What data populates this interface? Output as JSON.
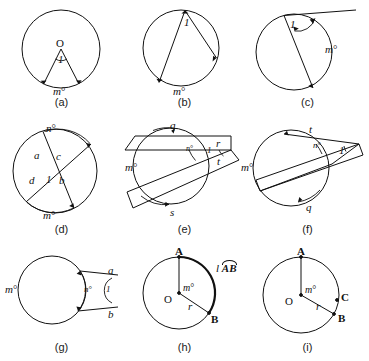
{
  "figure": {
    "title_visible": false,
    "panel_count": 9
  },
  "panels": [
    {
      "id": "a",
      "caption": "(a)",
      "type": "central-angle",
      "labels": {
        "center": "O",
        "angle": "1",
        "arc": "m",
        "degree": "°"
      }
    },
    {
      "id": "b",
      "caption": "(b)",
      "type": "inscribed-angle",
      "labels": {
        "angle": "1",
        "arc": "m",
        "degree": "°"
      }
    },
    {
      "id": "c",
      "caption": "(c)",
      "type": "tangent-chord-angle",
      "labels": {
        "angle": "1",
        "arc": "m",
        "degree": "°"
      }
    },
    {
      "id": "d",
      "caption": "(d)",
      "type": "two-chords-intersecting",
      "labels": {
        "angle": "1",
        "seg_a": "a",
        "seg_b": "b",
        "seg_c": "c",
        "seg_d": "d",
        "arc_top": "n",
        "arc_bottom": "m",
        "degree": "°"
      }
    },
    {
      "id": "e",
      "caption": "(e)",
      "type": "two-secants",
      "labels": {
        "angle": "1",
        "seg_q": "q",
        "seg_r": "r",
        "seg_s": "s",
        "seg_t": "t",
        "arc_near": "n",
        "arc_far": "m",
        "degree": "°"
      }
    },
    {
      "id": "f",
      "caption": "(f)",
      "type": "secant-and-tangent",
      "labels": {
        "angle": "1",
        "seg_t": "t",
        "seg_q": "q",
        "arc_near": "n",
        "arc_far": "m",
        "degree": "°"
      }
    },
    {
      "id": "g",
      "caption": "(g)",
      "type": "two-tangents",
      "labels": {
        "angle": "1",
        "seg_a": "a",
        "seg_b": "b",
        "arc_near": "n",
        "arc_far": "m",
        "degree": "°"
      }
    },
    {
      "id": "h",
      "caption": "(h)",
      "type": "arc-length",
      "labels": {
        "center": "O",
        "point_a": "A",
        "point_b": "B",
        "radius": "r",
        "central_angle": "m",
        "degree": "°",
        "arc_measure_prefix": "l",
        "arc_measure_arc": "AB"
      }
    },
    {
      "id": "i",
      "caption": "(i)",
      "type": "sector-area",
      "labels": {
        "center": "O",
        "point_a": "A",
        "point_b": "B",
        "point_c": "C",
        "radius": "r",
        "central_angle": "m",
        "degree": "°"
      }
    }
  ]
}
